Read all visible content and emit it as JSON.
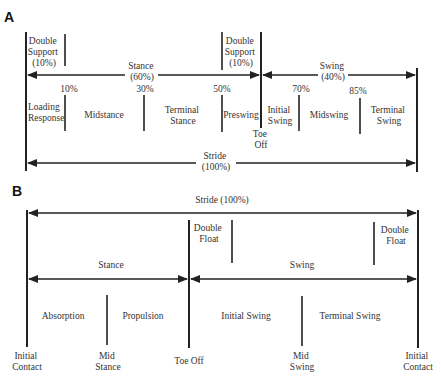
{
  "panel_a": {
    "label": "A",
    "double_support_left": [
      "Double",
      "Support",
      "(10%)"
    ],
    "double_support_right": [
      "Double",
      "Support",
      "(10%)"
    ],
    "stance": [
      "Stance",
      "(60%)"
    ],
    "swing": [
      "Swing",
      "(40%)"
    ],
    "percents": [
      "10%",
      "30%",
      "50%",
      "70%",
      "85%"
    ],
    "phases": {
      "loading_response": [
        "Loading",
        "Response"
      ],
      "midstance": "Midstance",
      "terminal_stance": [
        "Terminal",
        "Stance"
      ],
      "preswing": "Preswing",
      "initial_swing": [
        "Initial",
        "Swing"
      ],
      "midswing": "Midswing",
      "terminal_swing": [
        "Terminal",
        "Swing"
      ]
    },
    "toe_off": [
      "Toe",
      "Off"
    ],
    "stride": [
      "Stride",
      "(100%)"
    ]
  },
  "panel_b": {
    "label": "B",
    "stride": "Stride (100%)",
    "double_float_left": [
      "Double",
      "Float"
    ],
    "double_float_right": [
      "Double",
      "Float"
    ],
    "stance": "Stance",
    "swing": "Swing",
    "phases": {
      "absorption": "Absorption",
      "propulsion": "Propulsion",
      "initial_swing": "Initial Swing",
      "terminal_swing": "Terminal Swing"
    },
    "events": {
      "initial_contact_left": [
        "Initial",
        "Contact"
      ],
      "mid_stance": [
        "Mid",
        "Stance"
      ],
      "toe_off": "Toe Off",
      "mid_swing": [
        "Mid",
        "Swing"
      ],
      "initial_contact_right": [
        "Initial",
        "Contact"
      ]
    }
  },
  "colors": {
    "line": "#222222",
    "text": "#333333",
    "background": "#ffffff"
  }
}
